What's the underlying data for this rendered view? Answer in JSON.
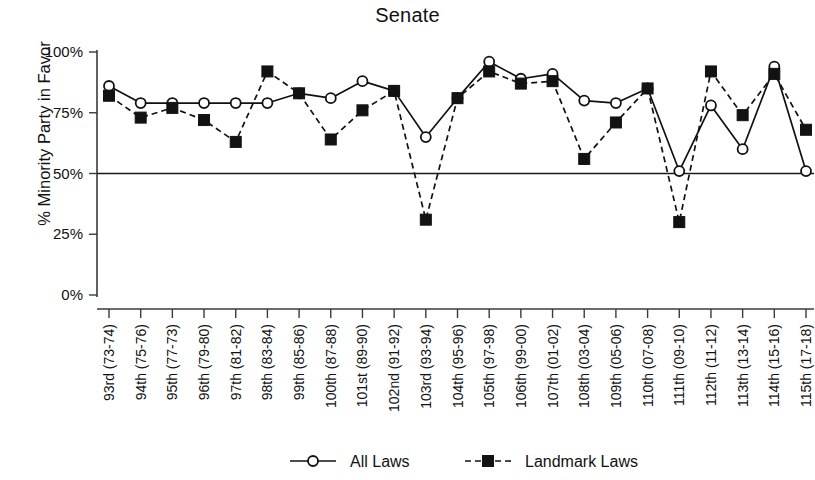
{
  "chart_data": {
    "type": "line",
    "title": "Senate",
    "xlabel": "",
    "ylabel": "% Minority Party in Favor",
    "ylim": [
      0,
      100
    ],
    "ytick_labels": [
      "0%",
      "25%",
      "50%",
      "75%",
      "100%"
    ],
    "ytick_values": [
      0,
      25,
      50,
      75,
      100
    ],
    "grid": false,
    "legend_position": "bottom",
    "reference_line": {
      "value": 50,
      "label": ""
    },
    "categories": [
      "93rd (73-74)",
      "94th (75-76)",
      "95th (77-73)",
      "96th (79-80)",
      "97th (81-82)",
      "98th (83-84)",
      "99th (85-86)",
      "100th (87-88)",
      "101st (89-90)",
      "102nd (91-92)",
      "103rd (93-94)",
      "104th (95-96)",
      "105th (97-98)",
      "106th (99-00)",
      "107th (01-02)",
      "108th (03-04)",
      "109th (05-06)",
      "110th (07-08)",
      "111th (09-10)",
      "112th (11-12)",
      "113th (13-14)",
      "114th (15-16)",
      "115th (17-18)"
    ],
    "series": [
      {
        "name": "All Laws",
        "marker": "open-circle",
        "line_style": "solid",
        "color": "#111111",
        "values": [
          86,
          79,
          79,
          79,
          79,
          79,
          83,
          81,
          88,
          84,
          65,
          81,
          96,
          89,
          91,
          80,
          79,
          85,
          51,
          78,
          60,
          94,
          51
        ]
      },
      {
        "name": "Landmark Laws",
        "marker": "filled-square",
        "line_style": "dashed",
        "color": "#111111",
        "values": [
          82,
          73,
          77,
          72,
          63,
          92,
          83,
          64,
          76,
          84,
          31,
          81,
          92,
          87,
          88,
          56,
          71,
          85,
          30,
          92,
          74,
          91,
          68
        ]
      }
    ]
  },
  "legend": {
    "items": [
      {
        "label": "All Laws",
        "marker": "open-circle",
        "line_style": "solid"
      },
      {
        "label": "Landmark Laws",
        "marker": "filled-square",
        "line_style": "dashed"
      }
    ]
  }
}
